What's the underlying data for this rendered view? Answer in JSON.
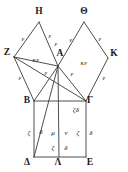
{
  "figure": {
    "kind": "euclid-i47-pythagorean-diagram",
    "width": 128,
    "height": 172,
    "stroke_color": "#3a3a3a",
    "text_color": "#1a1a1a",
    "background_color": "#ffffff"
  },
  "vertices": [
    {
      "id": "H",
      "label": "H",
      "x": 39,
      "y": 12
    },
    {
      "id": "Theta",
      "label": "Θ",
      "x": 84,
      "y": 12
    },
    {
      "id": "Z",
      "label": "Z",
      "x": 7,
      "y": 53
    },
    {
      "id": "A",
      "label": "A",
      "x": 60,
      "y": 54
    },
    {
      "id": "K",
      "label": "K",
      "x": 114,
      "y": 54
    },
    {
      "id": "B",
      "label": "B",
      "x": 27,
      "y": 101
    },
    {
      "id": "Gamma",
      "label": "Γ",
      "x": 90,
      "y": 101
    },
    {
      "id": "Delta",
      "label": "Δ",
      "x": 27,
      "y": 163
    },
    {
      "id": "Lambda",
      "label": "Λ",
      "x": 58,
      "y": 163
    },
    {
      "id": "E",
      "label": "E",
      "x": 90,
      "y": 163
    }
  ],
  "points": {
    "H": {
      "x": 39,
      "y": 22
    },
    "Theta": {
      "x": 84,
      "y": 22
    },
    "Z": {
      "x": 14,
      "y": 57
    },
    "A": {
      "x": 58,
      "y": 66
    },
    "K": {
      "x": 108,
      "y": 58
    },
    "B": {
      "x": 34,
      "y": 101
    },
    "Gamma": {
      "x": 86,
      "y": 101
    },
    "Delta": {
      "x": 34,
      "y": 157
    },
    "Lambda": {
      "x": 59,
      "y": 157
    },
    "E": {
      "x": 86,
      "y": 157
    }
  },
  "edge_labels": [
    {
      "id": "eps-ZH",
      "text": "ε",
      "x": 23,
      "y": 39
    },
    {
      "id": "eps-HA",
      "text": "ε",
      "x": 50,
      "y": 36
    },
    {
      "id": "eps-AH-low",
      "text": "ε",
      "x": 56,
      "y": 44
    },
    {
      "id": "eps-AT",
      "text": "ε",
      "x": 71,
      "y": 40
    },
    {
      "id": "eps-TK",
      "text": "ε",
      "x": 100,
      "y": 39
    },
    {
      "id": "eps-ZB",
      "text": "ε",
      "x": 20,
      "y": 78
    },
    {
      "id": "eps-AB",
      "text": "ε",
      "x": 46,
      "y": 73
    },
    {
      "id": "eps-AG",
      "text": "ε",
      "x": 72,
      "y": 74
    },
    {
      "id": "eps-KG",
      "text": "ε",
      "x": 104,
      "y": 78
    },
    {
      "id": "kappa-eps-left",
      "text": "κε",
      "x": 36,
      "y": 60
    },
    {
      "id": "kappa-eps-right",
      "text": "κε",
      "x": 84,
      "y": 63
    },
    {
      "id": "zeta-delta-gamma",
      "text": "ζδ",
      "x": 76,
      "y": 110
    },
    {
      "id": "zeta-left",
      "text": "ζ",
      "x": 29,
      "y": 133
    },
    {
      "id": "delta-left",
      "text": "δ",
      "x": 41,
      "y": 132
    },
    {
      "id": "mu",
      "text": "μ",
      "x": 53,
      "y": 133
    },
    {
      "id": "nu",
      "text": "ν",
      "x": 66,
      "y": 133
    },
    {
      "id": "zeta-right",
      "text": "ζ",
      "x": 78,
      "y": 133
    },
    {
      "id": "delta-right",
      "text": "δ",
      "x": 91,
      "y": 133
    },
    {
      "id": "zeta-bottom",
      "text": "ζ",
      "x": 53,
      "y": 148
    },
    {
      "id": "delta-bottom",
      "text": "δ",
      "x": 66,
      "y": 148
    }
  ],
  "segments": [
    {
      "id": "seg-Z-H",
      "from": "Z",
      "to": "H"
    },
    {
      "id": "seg-H-A",
      "from": "H",
      "to": "A"
    },
    {
      "id": "seg-Z-B",
      "from": "Z",
      "to": "B"
    },
    {
      "id": "seg-A-Theta",
      "from": "A",
      "to": "Theta"
    },
    {
      "id": "seg-Theta-K",
      "from": "Theta",
      "to": "K"
    },
    {
      "id": "seg-K-Gamma",
      "from": "K",
      "to": "Gamma"
    },
    {
      "id": "seg-A-B",
      "from": "A",
      "to": "B"
    },
    {
      "id": "seg-A-Gamma",
      "from": "A",
      "to": "Gamma"
    },
    {
      "id": "seg-B-Gamma",
      "from": "B",
      "to": "Gamma"
    },
    {
      "id": "seg-B-Delta",
      "from": "B",
      "to": "Delta"
    },
    {
      "id": "seg-Gamma-E",
      "from": "Gamma",
      "to": "E"
    },
    {
      "id": "seg-Delta-E",
      "from": "Delta",
      "to": "E"
    },
    {
      "id": "seg-A-Lambda",
      "from": "A",
      "to": "Lambda"
    },
    {
      "id": "seg-Z-Gamma",
      "from": "Z",
      "to": "Gamma"
    },
    {
      "id": "seg-A-Delta",
      "from": "A",
      "to": "Delta"
    },
    {
      "id": "seg-Z-A",
      "from": "Z",
      "to": "A"
    }
  ]
}
